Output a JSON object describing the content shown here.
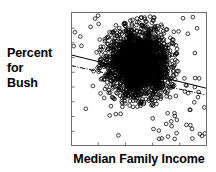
{
  "figure": {
    "width": 216,
    "height": 172,
    "background": "#ffffff",
    "ink": "#000000"
  },
  "axis_labels": {
    "y_line1": "Percent",
    "y_line2": "for",
    "y_line3": "Bush",
    "x": "Median Family Income"
  },
  "chart_data": {
    "type": "scatter",
    "title": "",
    "xlabel": "Median Family Income",
    "ylabel": "Percent for Bush",
    "xlim": [
      0,
      100
    ],
    "ylim": [
      0,
      100
    ],
    "grid": false,
    "legend": null,
    "xticklabels": [],
    "yticklabels": [],
    "xtick_positions": [
      0,
      20,
      40,
      60,
      80,
      100
    ],
    "ytick_positions": [
      0,
      11,
      22,
      33,
      44,
      55,
      66,
      77,
      88,
      100
    ],
    "marker": {
      "style": "open-circle",
      "size": 2.6,
      "color": "#000000",
      "fill": "none"
    },
    "cloud": {
      "description": "dense overplotted blob of open circles with sparse halo",
      "center_x": 50,
      "center_y": 62,
      "core_radius_x": 17,
      "core_radius_y": 19,
      "n_core": 2200,
      "n_halo": 420,
      "n_outliers": 95
    },
    "series": [
      {
        "name": "counties",
        "n_points": 2715,
        "x": [
          50
        ],
        "y": [
          62
        ]
      }
    ],
    "fit_lines": [
      {
        "name": "ordinary-least-squares",
        "style": "solid",
        "color": "#000000",
        "width": 1.0,
        "x0": 0,
        "y0": 68,
        "x1": 100,
        "y1": 43
      },
      {
        "name": "weighted-fit",
        "style": "dash-dot",
        "color": "#000000",
        "width": 1.0,
        "x0": 0,
        "y0": 60,
        "x1": 100,
        "y1": 38
      }
    ],
    "annotations": []
  }
}
